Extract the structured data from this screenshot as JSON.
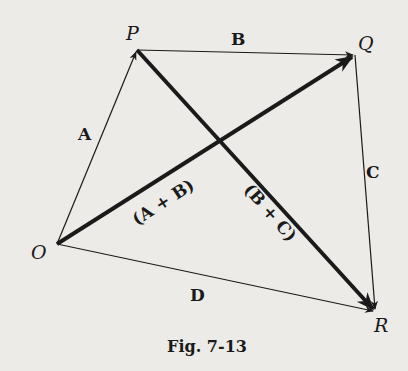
{
  "figure": {
    "caption": "Fig. 7-13",
    "points": {
      "O": {
        "label": "O",
        "x": 57,
        "y": 244
      },
      "P": {
        "label": "P",
        "x": 137,
        "y": 50
      },
      "Q": {
        "label": "Q",
        "x": 355,
        "y": 55
      },
      "R": {
        "label": "R",
        "x": 375,
        "y": 311
      }
    },
    "vectors": {
      "A": {
        "label": "A",
        "from": "O",
        "to": "P",
        "weight": "thin"
      },
      "B": {
        "label": "B",
        "from": "P",
        "to": "Q",
        "weight": "thin"
      },
      "C": {
        "label": "C",
        "from": "Q",
        "to": "R",
        "weight": "thin"
      },
      "D": {
        "label": "D",
        "from": "O",
        "to": "R",
        "weight": "thin"
      },
      "A_plus_B": {
        "label": "(A + B)",
        "from": "O",
        "to": "Q",
        "weight": "thick"
      },
      "B_plus_C": {
        "label": "(B + C)",
        "from": "P",
        "to": "R",
        "weight": "thick"
      }
    },
    "colors": {
      "background": "#ecebe8",
      "ink": "#1a1a1a"
    }
  }
}
